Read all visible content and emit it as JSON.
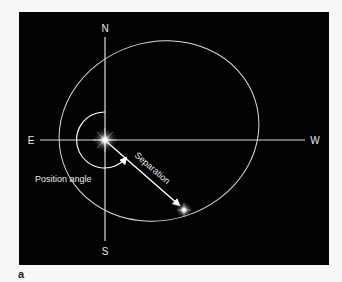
{
  "figure": {
    "panel_label": "a",
    "background_color": "#030303",
    "line_color": "#e6e6e6",
    "text_color": "#e8e8e8"
  },
  "compass": {
    "north": "N",
    "south": "S",
    "east": "E",
    "west": "W"
  },
  "annotations": {
    "position_angle": "Position angle",
    "separation": "Separation"
  },
  "objects": {
    "primary_star": {
      "name": "primary star",
      "x": 105,
      "y": 140
    },
    "companion_star": {
      "name": "companion star",
      "x": 184,
      "y": 210
    }
  },
  "orbit": {
    "center_x": 159,
    "center_y": 131,
    "rx": 101,
    "ry": 89,
    "rotation_deg": -18
  }
}
